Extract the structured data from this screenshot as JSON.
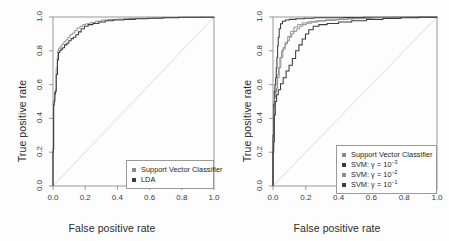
{
  "figure": {
    "background": "#fdfdfd",
    "panel_count": 2
  },
  "axes": {
    "xlabel": "False positive rate",
    "ylabel": "True positive rate",
    "xticks": [
      "0.0",
      "0.2",
      "0.4",
      "0.6",
      "0.8",
      "1.0"
    ],
    "yticks": [
      "0.0",
      "0.2",
      "0.4",
      "0.6",
      "0.8",
      "1.0"
    ]
  },
  "colors": {
    "curve_black": "#3c3c3c",
    "curve_gray": "#8c8c8c",
    "curve_midgray": "#6e6e6e",
    "diagonal": "#ebebeb",
    "frame": "#8f8f8f",
    "text": "#2b2b2b"
  },
  "left_panel": {
    "legend": [
      {
        "label": "Support Vector Classifier",
        "color": "#8c8c8c"
      },
      {
        "label": "LDA",
        "color": "#3c3c3c"
      }
    ]
  },
  "right_panel": {
    "legend": [
      {
        "label": "Support Vector Classifier",
        "label_html": "Support Vector Classifier",
        "color": "#8c8c8c"
      },
      {
        "label": "SVM: γ = 10⁻³",
        "label_html": "SVM: γ = 10<sup>−3</sup>",
        "color": "#3c3c3c"
      },
      {
        "label": "SVM: γ = 10⁻²",
        "label_html": "SVM: γ = 10<sup>−2</sup>",
        "color": "#8c8c8c"
      },
      {
        "label": "SVM: γ = 10⁻¹",
        "label_html": "SVM: γ = 10<sup>−1</sup>",
        "color": "#3c3c3c"
      }
    ]
  },
  "chart_data": [
    {
      "type": "line",
      "title": "",
      "xlabel": "False positive rate",
      "ylabel": "True positive rate",
      "xlim": [
        0,
        1
      ],
      "ylim": [
        0,
        1
      ],
      "grid": false,
      "legend_position": "bottom-right",
      "annotations": [
        "diagonal chance reference line from (0,0) to (1,1)"
      ],
      "series": [
        {
          "name": "Support Vector Classifier",
          "color": "#8c8c8c",
          "points": [
            [
              0.0,
              0.0
            ],
            [
              0.0,
              0.215
            ],
            [
              0.004,
              0.23
            ],
            [
              0.004,
              0.5
            ],
            [
              0.008,
              0.52
            ],
            [
              0.01,
              0.56
            ],
            [
              0.018,
              0.575
            ],
            [
              0.02,
              0.7
            ],
            [
              0.026,
              0.76
            ],
            [
              0.03,
              0.8
            ],
            [
              0.034,
              0.815
            ],
            [
              0.045,
              0.825
            ],
            [
              0.055,
              0.84
            ],
            [
              0.068,
              0.855
            ],
            [
              0.08,
              0.865
            ],
            [
              0.092,
              0.88
            ],
            [
              0.105,
              0.895
            ],
            [
              0.12,
              0.905
            ],
            [
              0.135,
              0.92
            ],
            [
              0.15,
              0.935
            ],
            [
              0.168,
              0.945
            ],
            [
              0.185,
              0.955
            ],
            [
              0.205,
              0.96
            ],
            [
              0.23,
              0.968
            ],
            [
              0.265,
              0.975
            ],
            [
              0.3,
              0.982
            ],
            [
              0.34,
              0.985
            ],
            [
              0.4,
              0.988
            ],
            [
              0.47,
              0.992
            ],
            [
              0.54,
              0.993
            ],
            [
              0.62,
              0.995
            ],
            [
              0.7,
              0.997
            ],
            [
              0.8,
              0.998
            ],
            [
              0.9,
              0.999
            ],
            [
              1.0,
              1.0
            ]
          ]
        },
        {
          "name": "LDA",
          "color": "#3c3c3c",
          "points": [
            [
              0.0,
              0.0
            ],
            [
              0.0,
              0.2
            ],
            [
              0.002,
              0.222
            ],
            [
              0.004,
              0.48
            ],
            [
              0.008,
              0.505
            ],
            [
              0.012,
              0.545
            ],
            [
              0.016,
              0.56
            ],
            [
              0.02,
              0.66
            ],
            [
              0.028,
              0.745
            ],
            [
              0.034,
              0.79
            ],
            [
              0.042,
              0.8
            ],
            [
              0.05,
              0.81
            ],
            [
              0.06,
              0.818
            ],
            [
              0.072,
              0.835
            ],
            [
              0.086,
              0.845
            ],
            [
              0.098,
              0.86
            ],
            [
              0.112,
              0.872
            ],
            [
              0.126,
              0.88
            ],
            [
              0.142,
              0.895
            ],
            [
              0.158,
              0.912
            ],
            [
              0.175,
              0.93
            ],
            [
              0.195,
              0.945
            ],
            [
              0.218,
              0.955
            ],
            [
              0.248,
              0.962
            ],
            [
              0.285,
              0.97
            ],
            [
              0.325,
              0.978
            ],
            [
              0.375,
              0.982
            ],
            [
              0.44,
              0.986
            ],
            [
              0.51,
              0.99
            ],
            [
              0.59,
              0.993
            ],
            [
              0.68,
              0.996
            ],
            [
              0.78,
              0.998
            ],
            [
              0.88,
              0.999
            ],
            [
              1.0,
              1.0
            ]
          ]
        }
      ]
    },
    {
      "type": "line",
      "title": "",
      "xlabel": "False positive rate",
      "ylabel": "True positive rate",
      "xlim": [
        0,
        1
      ],
      "ylim": [
        0,
        1
      ],
      "grid": false,
      "legend_position": "bottom-right",
      "annotations": [
        "diagonal chance reference line from (0,0) to (1,1)"
      ],
      "series": [
        {
          "name": "Support Vector Classifier",
          "color": "#8c8c8c",
          "points": [
            [
              0.0,
              0.0
            ],
            [
              0.0,
              0.215
            ],
            [
              0.004,
              0.295
            ],
            [
              0.006,
              0.5
            ],
            [
              0.01,
              0.52
            ],
            [
              0.014,
              0.56
            ],
            [
              0.02,
              0.575
            ],
            [
              0.026,
              0.66
            ],
            [
              0.034,
              0.7
            ],
            [
              0.042,
              0.76
            ],
            [
              0.052,
              0.8
            ],
            [
              0.062,
              0.82
            ],
            [
              0.074,
              0.84
            ],
            [
              0.088,
              0.86
            ],
            [
              0.1,
              0.88
            ],
            [
              0.114,
              0.9
            ],
            [
              0.128,
              0.915
            ],
            [
              0.145,
              0.93
            ],
            [
              0.162,
              0.945
            ],
            [
              0.182,
              0.955
            ],
            [
              0.205,
              0.963
            ],
            [
              0.235,
              0.97
            ],
            [
              0.275,
              0.976
            ],
            [
              0.32,
              0.98
            ],
            [
              0.38,
              0.985
            ],
            [
              0.45,
              0.99
            ],
            [
              0.53,
              0.993
            ],
            [
              0.62,
              0.996
            ],
            [
              0.72,
              0.998
            ],
            [
              0.84,
              0.999
            ],
            [
              1.0,
              1.0
            ]
          ]
        },
        {
          "name": "SVM: γ = 10⁻³",
          "color": "#3c3c3c",
          "points": [
            [
              0.0,
              0.0
            ],
            [
              0.0,
              0.3
            ],
            [
              0.004,
              0.48
            ],
            [
              0.008,
              0.56
            ],
            [
              0.012,
              0.6
            ],
            [
              0.016,
              0.64
            ],
            [
              0.02,
              0.7
            ],
            [
              0.024,
              0.76
            ],
            [
              0.028,
              0.83
            ],
            [
              0.032,
              0.88
            ],
            [
              0.038,
              0.93
            ],
            [
              0.046,
              0.96
            ],
            [
              0.058,
              0.975
            ],
            [
              0.075,
              0.982
            ],
            [
              0.1,
              0.986
            ],
            [
              0.14,
              0.99
            ],
            [
              0.19,
              0.993
            ],
            [
              0.25,
              0.995
            ],
            [
              0.33,
              0.996
            ],
            [
              0.43,
              0.997
            ],
            [
              0.55,
              0.998
            ],
            [
              0.7,
              0.999
            ],
            [
              0.85,
              0.999
            ],
            [
              1.0,
              1.0
            ]
          ]
        },
        {
          "name": "SVM: γ = 10⁻²",
          "color": "#8c8c8c",
          "points": [
            [
              0.0,
              0.0
            ],
            [
              0.0,
              0.21
            ],
            [
              0.002,
              0.28
            ],
            [
              0.006,
              0.47
            ],
            [
              0.01,
              0.52
            ],
            [
              0.014,
              0.55
            ],
            [
              0.02,
              0.58
            ],
            [
              0.028,
              0.64
            ],
            [
              0.038,
              0.7
            ],
            [
              0.048,
              0.76
            ],
            [
              0.06,
              0.81
            ],
            [
              0.074,
              0.85
            ],
            [
              0.09,
              0.885
            ],
            [
              0.108,
              0.915
            ],
            [
              0.128,
              0.94
            ],
            [
              0.15,
              0.955
            ],
            [
              0.178,
              0.965
            ],
            [
              0.215,
              0.972
            ],
            [
              0.26,
              0.978
            ],
            [
              0.32,
              0.983
            ],
            [
              0.4,
              0.988
            ],
            [
              0.49,
              0.992
            ],
            [
              0.6,
              0.995
            ],
            [
              0.73,
              0.998
            ],
            [
              0.87,
              0.999
            ],
            [
              1.0,
              1.0
            ]
          ]
        },
        {
          "name": "SVM: γ = 10⁻¹",
          "color": "#3c3c3c",
          "points": [
            [
              0.0,
              0.0
            ],
            [
              0.0,
              0.2
            ],
            [
              0.004,
              0.26
            ],
            [
              0.008,
              0.42
            ],
            [
              0.014,
              0.5
            ],
            [
              0.022,
              0.54
            ],
            [
              0.032,
              0.57
            ],
            [
              0.046,
              0.605
            ],
            [
              0.062,
              0.64
            ],
            [
              0.08,
              0.68
            ],
            [
              0.098,
              0.715
            ],
            [
              0.118,
              0.755
            ],
            [
              0.138,
              0.8
            ],
            [
              0.158,
              0.835
            ],
            [
              0.178,
              0.87
            ],
            [
              0.198,
              0.9
            ],
            [
              0.218,
              0.925
            ],
            [
              0.245,
              0.945
            ],
            [
              0.28,
              0.955
            ],
            [
              0.33,
              0.962
            ],
            [
              0.4,
              0.97
            ],
            [
              0.48,
              0.978
            ],
            [
              0.57,
              0.985
            ],
            [
              0.67,
              0.991
            ],
            [
              0.78,
              0.996
            ],
            [
              0.89,
              0.999
            ],
            [
              1.0,
              1.0
            ]
          ]
        }
      ]
    }
  ]
}
